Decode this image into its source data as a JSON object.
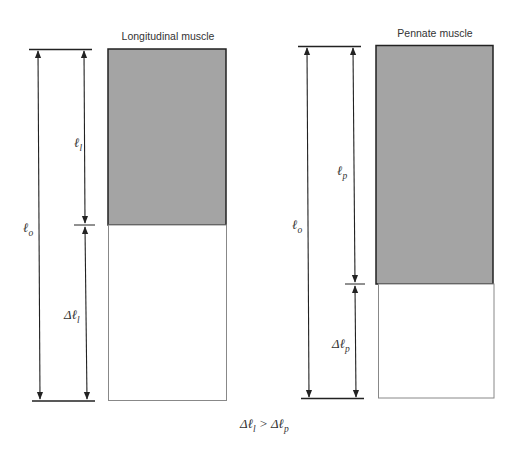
{
  "diagram": {
    "colors": {
      "muscle_fill": "#a4a4a4",
      "line": "#222222",
      "text": "#333333"
    },
    "left_panel": {
      "title": "Longitudinal muscle",
      "label_total": {
        "main": "ℓ",
        "sub": "o"
      },
      "label_muscle": {
        "main": "ℓ",
        "sub": "l"
      },
      "label_delta": {
        "prefix": "Δℓ",
        "sub": "l"
      }
    },
    "right_panel": {
      "title": "Pennate muscle",
      "label_total": {
        "main": "ℓ",
        "sub": "o"
      },
      "label_muscle": {
        "main": "ℓ",
        "sub": "p"
      },
      "label_delta": {
        "prefix": "Δℓ",
        "sub": "p"
      }
    },
    "relation": {
      "left": "Δℓ",
      "left_sub": "l",
      "op": " > ",
      "right": "Δℓ",
      "right_sub": "p"
    }
  }
}
